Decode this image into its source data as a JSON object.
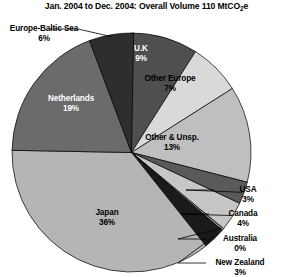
{
  "chart_data": {
    "type": "pie",
    "title": "Jan. 2004 to Dec. 2004: Overall Volume 110 MtCO2e",
    "title_prefix": "Jan. 2004 to Dec. 2004: Overall Volume 110 MtCO",
    "title_sub": "2",
    "title_suffix": "e",
    "total_label": "110 MtCO2e",
    "total_value": 110,
    "units": "MtCO2e",
    "period_start": "Jan. 2004",
    "period_end": "Dec. 2004",
    "xlabel": "",
    "ylabel": "",
    "grid": false,
    "legend": false,
    "start_angle_deg": 0,
    "direction": "clockwise",
    "categories": [
      "U.K",
      "Other Europe",
      "Other & Unsp.",
      "USA",
      "Canada",
      "Australia",
      "New Zealand",
      "Japan",
      "Netherlands",
      "Europe-Baltic Sea"
    ],
    "values": [
      9,
      7,
      13,
      3,
      4,
      0,
      3,
      36,
      19,
      6
    ],
    "slices": [
      {
        "label": "U.K",
        "pct": 9,
        "pct_text": "9%",
        "color": "#4f4f4f",
        "label_placement": "inside",
        "label_tone": "on-dark",
        "label_x": 141,
        "label_y": 44,
        "leader": false
      },
      {
        "label": "Other Europe",
        "pct": 7,
        "pct_text": "7%",
        "color": "#d9d9d9",
        "label_placement": "outside",
        "label_tone": "outside",
        "label_x": 170,
        "label_y": 74,
        "leader": false
      },
      {
        "label": "Other & Unsp.",
        "pct": 13,
        "pct_text": "13%",
        "color": "#bfbfbf",
        "label_placement": "outside",
        "label_tone": "outside",
        "label_x": 172,
        "label_y": 133,
        "leader": false
      },
      {
        "label": "USA",
        "pct": 3,
        "pct_text": "3%",
        "color": "#5a5a5a",
        "label_placement": "outside",
        "label_tone": "outside",
        "label_x": 248,
        "label_y": 185,
        "leader": true
      },
      {
        "label": "Canada",
        "pct": 4,
        "pct_text": "4%",
        "color": "#c6c6c6",
        "label_placement": "outside",
        "label_tone": "outside",
        "label_x": 243,
        "label_y": 209,
        "leader": true
      },
      {
        "label": "Australia",
        "pct": 0,
        "pct_text": "0%",
        "color": "#8a8a8a",
        "label_placement": "outside",
        "label_tone": "outside",
        "label_x": 240,
        "label_y": 234,
        "leader": true
      },
      {
        "label": "New Zealand",
        "pct": 3,
        "pct_text": "3%",
        "color": "#1a1a1a",
        "label_placement": "outside",
        "label_tone": "outside",
        "label_x": 240,
        "label_y": 258,
        "leader": true
      },
      {
        "label": "Japan",
        "pct": 36,
        "pct_text": "36%",
        "color": "#b5b5b5",
        "label_placement": "inside",
        "label_tone": "on-light",
        "label_x": 107,
        "label_y": 208,
        "leader": false
      },
      {
        "label": "Netherlands",
        "pct": 19,
        "pct_text": "19%",
        "color": "#6b6b6b",
        "label_placement": "inside",
        "label_tone": "on-dark",
        "label_x": 71,
        "label_y": 94,
        "leader": false
      },
      {
        "label": "Europe-Baltic Sea",
        "pct": 6,
        "pct_text": "6%",
        "color": "#2e2e2e",
        "label_placement": "outside",
        "label_tone": "outside",
        "label_x": 44,
        "label_y": 24,
        "leader": true
      }
    ]
  }
}
